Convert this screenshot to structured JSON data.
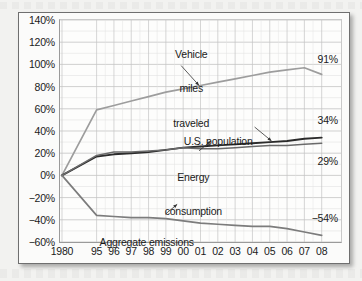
{
  "chart_data": {
    "type": "line",
    "title": "",
    "subtitle": "",
    "xlabel": "",
    "ylabel": "",
    "grid": true,
    "legend_position": "inline-annotations",
    "x": [
      "1980",
      "95",
      "96",
      "97",
      "98",
      "99",
      "00",
      "01",
      "02",
      "03",
      "04",
      "05",
      "06",
      "07",
      "08"
    ],
    "x_tick_labels": [
      "1980",
      "95",
      "96",
      "97",
      "98",
      "99",
      "00",
      "01",
      "02",
      "03",
      "04",
      "05",
      "06",
      "07",
      "08"
    ],
    "y_tick_labels": [
      "140%",
      "120%",
      "100%",
      "80%",
      "60%",
      "40%",
      "20%",
      "0%",
      "−20%",
      "−40%",
      "−60%"
    ],
    "y_tick_values": [
      140,
      120,
      100,
      80,
      60,
      40,
      20,
      0,
      -20,
      -40,
      -60
    ],
    "ylim": [
      -60,
      140
    ],
    "yunit": "%",
    "series": [
      {
        "name": "Vehicle miles traveled",
        "color": "#9d9d9d",
        "values": [
          0,
          59,
          63,
          67,
          71,
          75,
          78,
          81,
          84,
          87,
          90,
          93,
          95,
          97,
          91
        ],
        "end_label": "91%"
      },
      {
        "name": "U.S. population",
        "color": "#2b2b2b",
        "values": [
          0,
          17,
          19,
          20,
          21,
          23,
          25,
          26,
          27,
          28,
          29,
          30,
          31,
          33,
          34
        ],
        "end_label": "34%"
      },
      {
        "name": "Energy consumption",
        "color": "#6a6a6a",
        "values": [
          0,
          18,
          21,
          21,
          22,
          23,
          25,
          24,
          24,
          25,
          26,
          27,
          27,
          28,
          29
        ],
        "end_label": "29%"
      },
      {
        "name": "Aggregate emissions",
        "color": "#7c7c7c",
        "values": [
          0,
          -36,
          -37,
          -38,
          -38,
          -39,
          -41,
          -43,
          -44,
          -45,
          -46,
          -46,
          -48,
          -51,
          -54
        ],
        "end_label": "−54%"
      }
    ],
    "annotations": [
      {
        "id": "vehicle-miles-traveled",
        "text": "Vehicle\nmiles\ntraveled",
        "lines": [
          "Vehicle",
          "miles",
          "traveled"
        ],
        "target_series": "Vehicle miles traveled"
      },
      {
        "id": "us-population",
        "text": "U.S. population",
        "lines": [
          "U.S. population"
        ],
        "target_series": "U.S. population"
      },
      {
        "id": "energy-consumption",
        "text": "Energy\nconsumption",
        "lines": [
          "Energy",
          "consumption"
        ],
        "target_series": "Energy consumption"
      },
      {
        "id": "aggregate-emissions",
        "text": "Aggregate emissions",
        "lines": [
          "Aggregate emissions"
        ],
        "target_series": "Aggregate emissions"
      }
    ],
    "end_labels": [
      "91%",
      "34%",
      "29%",
      "−54%"
    ]
  },
  "axis": {
    "y_labels": {
      "t140": "140%",
      "t120": "120%",
      "t100": "100%",
      "t80": "80%",
      "t60": "60%",
      "t40": "40%",
      "t20": "20%",
      "t0": "0%",
      "tm20": "−20%",
      "tm40": "−40%",
      "tm60": "−60%"
    },
    "x_labels": {
      "x1980": "1980",
      "x95": "95",
      "x96": "96",
      "x97": "97",
      "x98": "98",
      "x99": "99",
      "x00": "00",
      "x01": "01",
      "x02": "02",
      "x03": "03",
      "x04": "04",
      "x05": "05",
      "x06": "06",
      "x07": "07",
      "x08": "08"
    }
  },
  "labels": {
    "vehicle_l1": "Vehicle",
    "vehicle_l2": "miles",
    "vehicle_l3": "traveled",
    "population": "U.S. population",
    "energy_l1": "Energy",
    "energy_l2": "consumption",
    "emissions": "Aggregate emissions",
    "end_vehicle": "91%",
    "end_population": "34%",
    "end_energy": "29%",
    "end_emissions": "−54%"
  },
  "colors": {
    "vehicle": "#9d9d9d",
    "population": "#2b2b2b",
    "energy": "#6a6a6a",
    "emissions": "#7c7c7c",
    "grid_major": "#c4c4c4",
    "grid_minor": "#e2e2e2",
    "axis": "#9a9a9a",
    "text": "#1a1a1a",
    "frame": "#6f6f6f",
    "page_bg": "#f2f2f0",
    "figure_bg": "#fbfbfa"
  }
}
